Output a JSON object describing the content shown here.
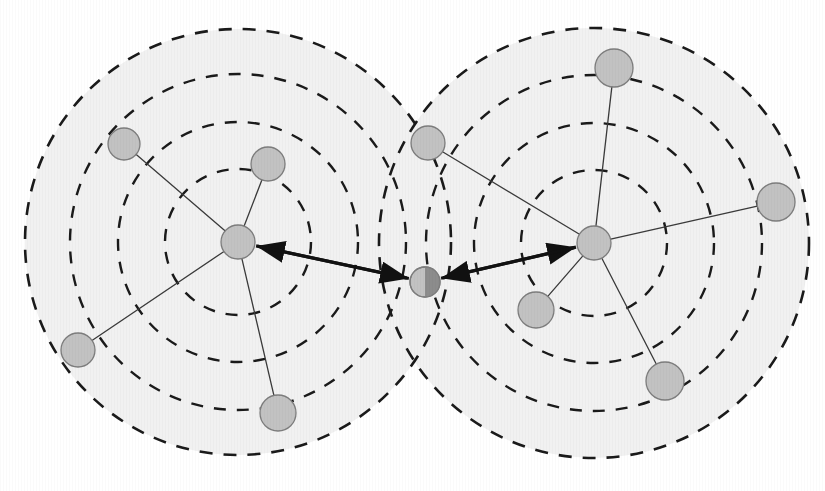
{
  "figure": {
    "type": "node-link-diagram",
    "width": 825,
    "height": 491,
    "background_color": "#ffffff"
  },
  "style": {
    "coverage_fill": "#f1f1f1",
    "coverage_stroke": "#1a1a1a",
    "coverage_stroke_width": 2.6,
    "coverage_dash": "13 11",
    "ring_stroke_width": 2.4,
    "ring_dash": "12 11",
    "node_fill": "#c2c2c2",
    "node_fill_dark": "#8c8c8c",
    "node_stroke": "#7d7d7d",
    "node_stroke_width": 1.3,
    "spoke_stroke": "#3a3a3a",
    "spoke_stroke_width": 1.3,
    "arrow_stroke": "#111111",
    "arrow_stroke_width": 3.2
  },
  "clusters": [
    {
      "id": "cluster-left",
      "label": "Left cluster",
      "center": {
        "x": 238,
        "y": 242
      },
      "ring_radii": [
        73,
        120,
        168,
        213
      ],
      "outer_radius": 213
    },
    {
      "id": "cluster-right",
      "label": "Right cluster",
      "center": {
        "x": 594,
        "y": 243
      },
      "ring_radii": [
        73,
        120,
        168,
        215
      ],
      "outer_radius": 215
    }
  ],
  "nodes": [
    {
      "id": "hub-left",
      "label": "Left hub",
      "kind": "hub",
      "cluster": "cluster-left",
      "x": 238,
      "y": 242,
      "r": 17,
      "split": false
    },
    {
      "id": "hub-right",
      "label": "Right hub",
      "kind": "hub",
      "cluster": "cluster-right",
      "x": 594,
      "y": 243,
      "r": 17,
      "split": false
    },
    {
      "id": "gateway",
      "label": "Shared gateway node",
      "kind": "gateway",
      "cluster": "shared",
      "x": 425,
      "y": 282,
      "r": 15,
      "split": true
    },
    {
      "id": "node-l1",
      "label": "Left node 1",
      "kind": "member",
      "cluster": "cluster-left",
      "x": 124,
      "y": 144,
      "r": 16,
      "split": false
    },
    {
      "id": "node-l2",
      "label": "Left node 2",
      "kind": "member",
      "cluster": "cluster-left",
      "x": 268,
      "y": 164,
      "r": 17,
      "split": false
    },
    {
      "id": "node-l3",
      "label": "Left node 3",
      "kind": "member",
      "cluster": "cluster-left",
      "x": 78,
      "y": 350,
      "r": 17,
      "split": false
    },
    {
      "id": "node-l4",
      "label": "Left node 4",
      "kind": "member",
      "cluster": "cluster-left",
      "x": 278,
      "y": 413,
      "r": 18,
      "split": false
    },
    {
      "id": "node-r0",
      "label": "Boundary node",
      "kind": "member",
      "cluster": "cluster-right",
      "x": 428,
      "y": 143,
      "r": 17,
      "split": false
    },
    {
      "id": "node-r1",
      "label": "Right node 1",
      "kind": "member",
      "cluster": "cluster-right",
      "x": 614,
      "y": 68,
      "r": 19,
      "split": false
    },
    {
      "id": "node-r2",
      "label": "Right node 2",
      "kind": "member",
      "cluster": "cluster-right",
      "x": 776,
      "y": 202,
      "r": 19,
      "split": false
    },
    {
      "id": "node-r3",
      "label": "Right node 3",
      "kind": "member",
      "cluster": "cluster-right",
      "x": 536,
      "y": 310,
      "r": 18,
      "split": false
    },
    {
      "id": "node-r4",
      "label": "Right node 4",
      "kind": "member",
      "cluster": "cluster-right",
      "x": 665,
      "y": 381,
      "r": 19,
      "split": false
    }
  ],
  "spokes": [
    {
      "id": "spoke-l1",
      "from": "hub-left",
      "to": "node-l1"
    },
    {
      "id": "spoke-l2",
      "from": "hub-left",
      "to": "node-l2"
    },
    {
      "id": "spoke-l3",
      "from": "hub-left",
      "to": "node-l3"
    },
    {
      "id": "spoke-l4",
      "from": "hub-left",
      "to": "node-l4"
    },
    {
      "id": "spoke-r0",
      "from": "hub-right",
      "to": "node-r0"
    },
    {
      "id": "spoke-r1",
      "from": "hub-right",
      "to": "node-r1"
    },
    {
      "id": "spoke-r2",
      "from": "hub-right",
      "to": "node-r2"
    },
    {
      "id": "spoke-r3",
      "from": "hub-right",
      "to": "node-r3"
    },
    {
      "id": "spoke-r4",
      "from": "hub-right",
      "to": "node-r4"
    }
  ],
  "arrows": [
    {
      "id": "arrow-gateway-to-left-hub",
      "from": "gateway",
      "to": "hub-left",
      "direction": "to-target"
    },
    {
      "id": "arrow-gateway-to-right-hub",
      "from": "gateway",
      "to": "hub-right",
      "direction": "to-target"
    },
    {
      "id": "arrow-left-hub-to-gateway",
      "from": "hub-left",
      "to": "gateway",
      "direction": "to-target"
    },
    {
      "id": "arrow-right-hub-to-gateway",
      "from": "hub-right",
      "to": "gateway",
      "direction": "to-target"
    }
  ]
}
